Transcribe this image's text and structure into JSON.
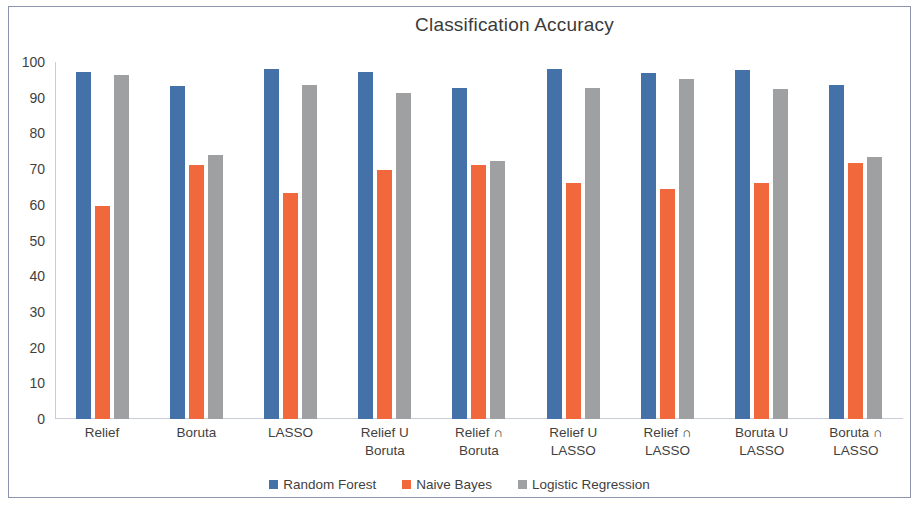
{
  "chart_data": {
    "type": "bar",
    "title": "Classification Accuracy",
    "xlabel": "",
    "ylabel": "",
    "ylim": [
      0,
      100
    ],
    "yticks": [
      0,
      10,
      20,
      30,
      40,
      50,
      60,
      70,
      80,
      90,
      100
    ],
    "grid": false,
    "legend_position": "bottom",
    "categories": [
      "Relief",
      "Boruta",
      "LASSO",
      "Relief U\nBoruta",
      "Relief  ∩\nBoruta",
      "Relief U  LASSO",
      "Relief ∩ LASSO",
      "Boruta U LASSO",
      "Boruta ∩ LASSO"
    ],
    "series": [
      {
        "name": "Random Forest",
        "color": "#4472a8",
        "values": [
          97.2,
          93.3,
          98.0,
          97.2,
          92.7,
          98.0,
          97.0,
          97.7,
          93.7
        ]
      },
      {
        "name": "Naive Bayes",
        "color": "#f0683c",
        "values": [
          59.7,
          71.2,
          63.3,
          69.7,
          71.2,
          66.1,
          64.5,
          66.1,
          71.6
        ]
      },
      {
        "name": "Logistic Regression",
        "color": "#9fa0a2",
        "values": [
          96.3,
          74.0,
          93.6,
          91.3,
          72.4,
          92.6,
          95.3,
          92.4,
          73.4
        ]
      }
    ]
  },
  "legend": {
    "items": [
      {
        "label": "Random Forest",
        "color": "#4472a8"
      },
      {
        "label": "Naive Bayes",
        "color": "#f0683c"
      },
      {
        "label": "Logistic Regression",
        "color": "#9fa0a2"
      }
    ]
  }
}
